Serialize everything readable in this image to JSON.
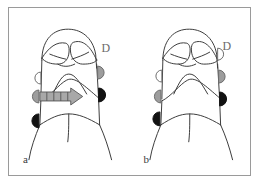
{
  "figure": {
    "background_color": "#ffffff",
    "frame_color": "#9a9a9a",
    "outline_color": "#3c3c3c"
  },
  "legend_colors": {
    "white_marker": "#ffffff",
    "gray_marker": "#9d9d9d",
    "black_marker": "#121212",
    "arrow_fill": "#a8a8a8",
    "arrow_stroke": "#555555"
  },
  "panels": [
    {
      "id": "a",
      "label": "a",
      "annotation_letter": "D",
      "arrow": {
        "present": true,
        "direction": "right",
        "segments": 4,
        "label": "penetration-arrow"
      },
      "markers": [
        {
          "side": "mesial",
          "position": "cervical-upper",
          "fill": "white",
          "name": "marker-a-mesial-white"
        },
        {
          "side": "mesial",
          "position": "cervical-lower",
          "fill": "gray",
          "name": "marker-a-mesial-gray"
        },
        {
          "side": "mesial",
          "position": "root",
          "fill": "black",
          "name": "marker-a-mesial-black"
        },
        {
          "side": "distal",
          "position": "cervical-upper",
          "fill": "gray",
          "name": "marker-a-distal-gray"
        },
        {
          "side": "distal",
          "position": "cervical-lower",
          "fill": "black",
          "name": "marker-a-distal-black"
        }
      ]
    },
    {
      "id": "b",
      "label": "b",
      "annotation_letter": "D",
      "arrow": {
        "present": false,
        "direction": "",
        "segments": 0,
        "label": ""
      },
      "markers": [
        {
          "side": "mesial",
          "position": "cervical-upper",
          "fill": "white",
          "name": "marker-b-mesial-white"
        },
        {
          "side": "mesial",
          "position": "cervical-lower",
          "fill": "gray",
          "name": "marker-b-mesial-gray"
        },
        {
          "side": "mesial",
          "position": "root",
          "fill": "black",
          "name": "marker-b-mesial-black"
        },
        {
          "side": "distal",
          "position": "cervical-upper",
          "fill": "white",
          "name": "marker-b-distal-white"
        },
        {
          "side": "distal",
          "position": "cervical-middle",
          "fill": "gray",
          "name": "marker-b-distal-gray"
        },
        {
          "side": "distal",
          "position": "cervical-lower",
          "fill": "black",
          "name": "marker-b-distal-black"
        }
      ]
    }
  ]
}
